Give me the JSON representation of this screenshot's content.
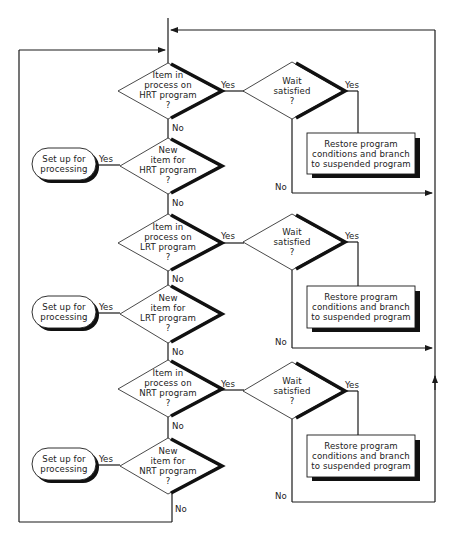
{
  "diagram": {
    "type": "flowchart",
    "sections": [
      {
        "program": "HRT",
        "in_process_decision": [
          "Item in",
          "process on",
          "HRT program",
          "?"
        ],
        "wait_decision": [
          "Wait",
          "satisfied",
          "?"
        ],
        "restore_box": [
          "Restore program",
          "conditions and branch",
          "to suspended program"
        ],
        "new_item_decision": [
          "New",
          "item for",
          "HRT program",
          "?"
        ],
        "setup_terminal": [
          "Set up for",
          "processing"
        ]
      },
      {
        "program": "LRT",
        "in_process_decision": [
          "Item in",
          "process on",
          "LRT program",
          "?"
        ],
        "wait_decision": [
          "Wait",
          "satisfied",
          "?"
        ],
        "restore_box": [
          "Restore program",
          "conditions and branch",
          "to suspended program"
        ],
        "new_item_decision": [
          "New",
          "item for",
          "LRT program",
          "?"
        ],
        "setup_terminal": [
          "Set up for",
          "processing"
        ]
      },
      {
        "program": "NRT",
        "in_process_decision": [
          "Item in",
          "process on",
          "NRT program",
          "?"
        ],
        "wait_decision": [
          "Wait",
          "satisfied",
          "?"
        ],
        "restore_box": [
          "Restore program",
          "conditions and branch",
          "to suspended program"
        ],
        "new_item_decision": [
          "New",
          "item for",
          "NRT program",
          "?"
        ],
        "setup_terminal": [
          "Set up for",
          "processing"
        ]
      }
    ],
    "labels": {
      "yes": "Yes",
      "no": "No"
    },
    "colors": {
      "line": "#1a1a1a",
      "background": "#ffffff"
    }
  }
}
